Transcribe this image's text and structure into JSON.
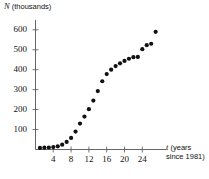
{
  "chart_data": {
    "type": "scatter",
    "title": "",
    "xlabel": "t (years since 1981)",
    "xlabel_var": "t",
    "xlabel_rest_line1": " (years",
    "xlabel_rest_line2": "since 1981)",
    "ylabel": "N (thousands)",
    "ylabel_var": "N",
    "ylabel_rest": " (thousands)",
    "xlim": [
      0,
      28
    ],
    "ylim": [
      0,
      640
    ],
    "grid": false,
    "legend": "none",
    "xticks": [
      4,
      8,
      12,
      16,
      20,
      24
    ],
    "yticks": [
      100,
      200,
      300,
      400,
      500,
      600
    ],
    "xtick_labels": [
      "4",
      "8",
      "12",
      "16",
      "20",
      "24"
    ],
    "ytick_labels": [
      "100",
      "200",
      "300",
      "400",
      "500",
      "600"
    ],
    "marker": "filled-circle",
    "marker_color": "#111111",
    "marker_size_px": 4.2,
    "axis_color": "#555555",
    "x": [
      1,
      2,
      3,
      4,
      5,
      6,
      7,
      8,
      9,
      10,
      11,
      12,
      13,
      14,
      15,
      16,
      17,
      18,
      19,
      20,
      21,
      22,
      23,
      24,
      25,
      26,
      27
    ],
    "y": [
      8,
      9,
      10,
      12,
      16,
      24,
      38,
      58,
      90,
      130,
      165,
      202,
      245,
      293,
      342,
      378,
      400,
      418,
      432,
      444,
      455,
      463,
      464,
      503,
      523,
      530,
      543,
      590
    ],
    "points": [
      {
        "t": 1,
        "N": 8
      },
      {
        "t": 2,
        "N": 9
      },
      {
        "t": 3,
        "N": 10
      },
      {
        "t": 4,
        "N": 12
      },
      {
        "t": 5,
        "N": 16
      },
      {
        "t": 6,
        "N": 24
      },
      {
        "t": 7,
        "N": 38
      },
      {
        "t": 8,
        "N": 58
      },
      {
        "t": 9,
        "N": 90
      },
      {
        "t": 10,
        "N": 130
      },
      {
        "t": 11,
        "N": 165
      },
      {
        "t": 12,
        "N": 202
      },
      {
        "t": 13,
        "N": 245
      },
      {
        "t": 14,
        "N": 293
      },
      {
        "t": 15,
        "N": 342
      },
      {
        "t": 16,
        "N": 378
      },
      {
        "t": 17,
        "N": 400
      },
      {
        "t": 18,
        "N": 418
      },
      {
        "t": 19,
        "N": 432
      },
      {
        "t": 20,
        "N": 444
      },
      {
        "t": 21,
        "N": 455
      },
      {
        "t": 22,
        "N": 463
      },
      {
        "t": 23,
        "N": 464
      },
      {
        "t": 24,
        "N": 503
      },
      {
        "t": 25,
        "N": 523
      },
      {
        "t": 26,
        "N": 530
      },
      {
        "t": 27,
        "N": 590
      }
    ]
  }
}
